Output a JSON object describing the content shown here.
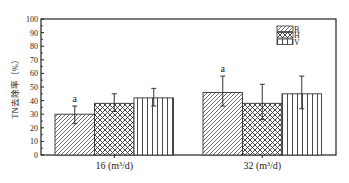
{
  "chart_data": {
    "type": "bar",
    "title": "",
    "xlabel": "",
    "ylabel": "TN去除率（%）",
    "ylim": [
      0,
      100
    ],
    "yticks": [
      0,
      10,
      20,
      30,
      40,
      50,
      60,
      70,
      80,
      90,
      100
    ],
    "grid": false,
    "legend_position": "upper right",
    "categories": [
      "16 (m³/d)",
      "32 (m³/d)"
    ],
    "series": [
      {
        "name": "B",
        "pattern": "diagonal-hatch",
        "values": [
          30,
          46
        ],
        "error_upper": [
          36,
          58
        ],
        "error_lower": [
          23,
          36
        ]
      },
      {
        "name": "H",
        "pattern": "crosshatch",
        "values": [
          38,
          38
        ],
        "error_upper": [
          45,
          52
        ],
        "error_lower": [
          32,
          26
        ]
      },
      {
        "name": "V",
        "pattern": "vertical-lines",
        "values": [
          42,
          45
        ],
        "error_upper": [
          49,
          58
        ],
        "error_lower": [
          36,
          34
        ]
      }
    ],
    "annotations": [
      {
        "text": "a",
        "category": "16 (m³/d)",
        "series": "B"
      },
      {
        "text": "a",
        "category": "32 (m³/d)",
        "series": "B"
      }
    ]
  }
}
